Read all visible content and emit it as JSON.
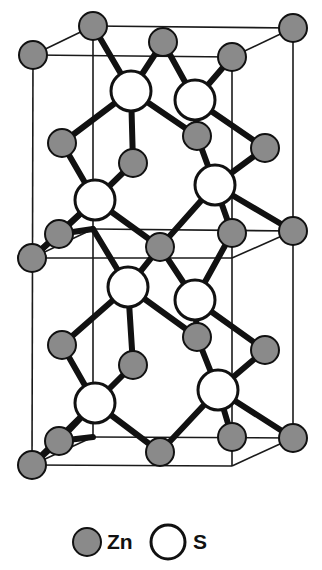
{
  "figure": {
    "canvas": {
      "width": 322,
      "height": 570
    },
    "colors": {
      "zn_fill": "#8a8a8a",
      "s_fill": "#ffffff",
      "outline": "#111111",
      "cell_edge": "#1a1a1a",
      "background": "#ffffff"
    },
    "projection": {
      "depth_dx": 61,
      "depth_dy": -29
    },
    "radii": {
      "zn": 14,
      "s": 20
    },
    "line_widths": {
      "cell_edge": 1.6,
      "bond": 6
    }
  },
  "legend": {
    "items": [
      {
        "symbol": "Zn",
        "label": "Zn",
        "kind": "zn",
        "cx": 87,
        "cy": 542,
        "r": 14,
        "text_x": 107,
        "text_y": 543
      },
      {
        "symbol": "S",
        "label": "S",
        "kind": "s",
        "cx": 168,
        "cy": 542,
        "r": 17,
        "text_x": 193,
        "text_y": 543
      }
    ]
  },
  "structure": {
    "cell_edges": [
      {
        "name": "front-top-upper",
        "x1": 33,
        "y1": 55,
        "x2": 232,
        "y2": 57
      },
      {
        "name": "front-mid",
        "x1": 32,
        "y1": 258,
        "x2": 232,
        "y2": 258
      },
      {
        "name": "front-bottom",
        "x1": 32,
        "y1": 465,
        "x2": 232,
        "y2": 466
      },
      {
        "name": "front-left-vert",
        "x1": 33,
        "y1": 55,
        "x2": 32,
        "y2": 465
      },
      {
        "name": "front-right-vert",
        "x1": 232,
        "y1": 57,
        "x2": 232,
        "y2": 466
      },
      {
        "name": "back-top",
        "x1": 93,
        "y1": 26,
        "x2": 293,
        "y2": 28
      },
      {
        "name": "back-mid",
        "x1": 93,
        "y1": 229,
        "x2": 293,
        "y2": 231
      },
      {
        "name": "back-bottom",
        "x1": 93,
        "y1": 437,
        "x2": 293,
        "y2": 438
      },
      {
        "name": "back-left-vert",
        "x1": 93,
        "y1": 26,
        "x2": 93,
        "y2": 437
      },
      {
        "name": "back-right-vert",
        "x1": 293,
        "y1": 28,
        "x2": 293,
        "y2": 438
      },
      {
        "name": "depth-top-left",
        "x1": 33,
        "y1": 55,
        "x2": 93,
        "y2": 26
      },
      {
        "name": "depth-top-right",
        "x1": 232,
        "y1": 57,
        "x2": 293,
        "y2": 28
      },
      {
        "name": "depth-mid-left",
        "x1": 32,
        "y1": 258,
        "x2": 93,
        "y2": 229
      },
      {
        "name": "depth-mid-right",
        "x1": 232,
        "y1": 258,
        "x2": 293,
        "y2": 231
      },
      {
        "name": "depth-bottom-left",
        "x1": 32,
        "y1": 465,
        "x2": 93,
        "y2": 437
      },
      {
        "name": "depth-bottom-right",
        "x1": 232,
        "y1": 466,
        "x2": 293,
        "y2": 438
      }
    ],
    "bonds": [
      {
        "x1": 93,
        "y1": 26,
        "x2": 131,
        "y2": 91
      },
      {
        "x1": 163,
        "y1": 42,
        "x2": 131,
        "y2": 91
      },
      {
        "x1": 163,
        "y1": 42,
        "x2": 195,
        "y2": 100
      },
      {
        "x1": 232,
        "y1": 57,
        "x2": 195,
        "y2": 100
      },
      {
        "x1": 131,
        "y1": 91,
        "x2": 62,
        "y2": 143
      },
      {
        "x1": 131,
        "y1": 91,
        "x2": 197,
        "y2": 136
      },
      {
        "x1": 195,
        "y1": 100,
        "x2": 197,
        "y2": 136
      },
      {
        "x1": 195,
        "y1": 100,
        "x2": 265,
        "y2": 148
      },
      {
        "x1": 62,
        "y1": 143,
        "x2": 95,
        "y2": 200
      },
      {
        "x1": 133,
        "y1": 163,
        "x2": 95,
        "y2": 200
      },
      {
        "x1": 131,
        "y1": 91,
        "x2": 133,
        "y2": 163
      },
      {
        "x1": 197,
        "y1": 136,
        "x2": 215,
        "y2": 185
      },
      {
        "x1": 265,
        "y1": 148,
        "x2": 215,
        "y2": 185
      },
      {
        "x1": 95,
        "y1": 200,
        "x2": 59,
        "y2": 234
      },
      {
        "x1": 95,
        "y1": 200,
        "x2": 160,
        "y2": 247
      },
      {
        "x1": 215,
        "y1": 185,
        "x2": 160,
        "y2": 247
      },
      {
        "x1": 215,
        "y1": 185,
        "x2": 232,
        "y2": 233
      },
      {
        "x1": 215,
        "y1": 185,
        "x2": 293,
        "y2": 231
      },
      {
        "x1": 59,
        "y1": 234,
        "x2": 32,
        "y2": 258
      },
      {
        "x1": 93,
        "y1": 229,
        "x2": 59,
        "y2": 234
      },
      {
        "x1": 32,
        "y1": 258,
        "x2": 95,
        "y2": 200
      },
      {
        "x1": 93,
        "y1": 229,
        "x2": 128,
        "y2": 287
      },
      {
        "x1": 160,
        "y1": 247,
        "x2": 128,
        "y2": 287
      },
      {
        "x1": 160,
        "y1": 247,
        "x2": 195,
        "y2": 300
      },
      {
        "x1": 232,
        "y1": 233,
        "x2": 195,
        "y2": 300
      },
      {
        "x1": 128,
        "y1": 287,
        "x2": 62,
        "y2": 345
      },
      {
        "x1": 128,
        "y1": 287,
        "x2": 197,
        "y2": 337
      },
      {
        "x1": 195,
        "y1": 300,
        "x2": 197,
        "y2": 337
      },
      {
        "x1": 195,
        "y1": 300,
        "x2": 265,
        "y2": 350
      },
      {
        "x1": 62,
        "y1": 345,
        "x2": 95,
        "y2": 403
      },
      {
        "x1": 133,
        "y1": 365,
        "x2": 95,
        "y2": 403
      },
      {
        "x1": 128,
        "y1": 287,
        "x2": 133,
        "y2": 365
      },
      {
        "x1": 197,
        "y1": 337,
        "x2": 218,
        "y2": 390
      },
      {
        "x1": 265,
        "y1": 350,
        "x2": 218,
        "y2": 390
      },
      {
        "x1": 95,
        "y1": 403,
        "x2": 59,
        "y2": 441
      },
      {
        "x1": 95,
        "y1": 403,
        "x2": 160,
        "y2": 452
      },
      {
        "x1": 218,
        "y1": 390,
        "x2": 160,
        "y2": 452
      },
      {
        "x1": 218,
        "y1": 390,
        "x2": 232,
        "y2": 437
      },
      {
        "x1": 218,
        "y1": 390,
        "x2": 293,
        "y2": 438
      },
      {
        "x1": 59,
        "y1": 441,
        "x2": 32,
        "y2": 465
      },
      {
        "x1": 93,
        "y1": 437,
        "x2": 59,
        "y2": 441
      },
      {
        "x1": 32,
        "y1": 465,
        "x2": 95,
        "y2": 403
      }
    ],
    "atoms_zn": [
      {
        "id": "zn-back-top-left",
        "cx": 93,
        "cy": 26
      },
      {
        "id": "zn-front-top-left",
        "cx": 33,
        "cy": 55
      },
      {
        "id": "zn-back-top-mid",
        "cx": 163,
        "cy": 42
      },
      {
        "id": "zn-back-top-right",
        "cx": 293,
        "cy": 28
      },
      {
        "id": "zn-front-top-right",
        "cx": 232,
        "cy": 57
      },
      {
        "id": "zn-upper-left",
        "cx": 62,
        "cy": 143
      },
      {
        "id": "zn-upper-inner-l",
        "cx": 133,
        "cy": 163
      },
      {
        "id": "zn-upper-inner-r",
        "cx": 197,
        "cy": 136
      },
      {
        "id": "zn-upper-right",
        "cx": 265,
        "cy": 148
      },
      {
        "id": "zn-mid-left-back",
        "cx": 59,
        "cy": 234
      },
      {
        "id": "zn-mid-left-front",
        "cx": 32,
        "cy": 258
      },
      {
        "id": "zn-mid-center",
        "cx": 160,
        "cy": 247
      },
      {
        "id": "zn-mid-right-front",
        "cx": 232,
        "cy": 233
      },
      {
        "id": "zn-mid-right-back",
        "cx": 293,
        "cy": 231
      },
      {
        "id": "zn-lower-left",
        "cx": 62,
        "cy": 345
      },
      {
        "id": "zn-lower-inner-l",
        "cx": 133,
        "cy": 365
      },
      {
        "id": "zn-lower-inner-r",
        "cx": 197,
        "cy": 337
      },
      {
        "id": "zn-lower-right",
        "cx": 265,
        "cy": 350
      },
      {
        "id": "zn-bot-left-back",
        "cx": 59,
        "cy": 441
      },
      {
        "id": "zn-bot-left-front",
        "cx": 32,
        "cy": 465
      },
      {
        "id": "zn-bot-center",
        "cx": 160,
        "cy": 452
      },
      {
        "id": "zn-bot-right-front",
        "cx": 232,
        "cy": 437
      },
      {
        "id": "zn-bot-right-back",
        "cx": 293,
        "cy": 438
      }
    ],
    "atoms_s": [
      {
        "id": "s-upper-left",
        "cx": 131,
        "cy": 91
      },
      {
        "id": "s-upper-right",
        "cx": 195,
        "cy": 100
      },
      {
        "id": "s-mid-left",
        "cx": 95,
        "cy": 200
      },
      {
        "id": "s-mid-right",
        "cx": 215,
        "cy": 185
      },
      {
        "id": "s-lower-left",
        "cx": 128,
        "cy": 287
      },
      {
        "id": "s-lower-right",
        "cx": 195,
        "cy": 300
      },
      {
        "id": "s-bot-left",
        "cx": 95,
        "cy": 403
      },
      {
        "id": "s-bot-right",
        "cx": 218,
        "cy": 390
      }
    ]
  }
}
